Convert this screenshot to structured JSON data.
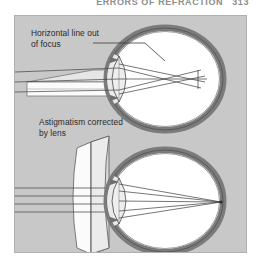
{
  "page": {
    "header_title": "ERRORS OF REFRACTION",
    "page_number": "313"
  },
  "figure": {
    "background_color": "#c8c8c8",
    "border_color": "#b0b0b0",
    "sclera_color": "#7b7b7b",
    "vitreous_color": "#ffffff",
    "ray_color": "#4a4a4a",
    "beam_fill": "#f2f2f2",
    "lens_fill": "#efefef",
    "panels": [
      {
        "id": "uncorrected",
        "label": "Horizontal line out\nof focus",
        "description": "Eye with astigmatism: horizontal rays focus in front of the retina, producing a blurred horizontal line."
      },
      {
        "id": "corrected",
        "label": "Astigmatism corrected\nby lens",
        "description": "Cylindrical spectacle lens placed before the eye brings the horizontal rays to a single point on the retina."
      }
    ]
  }
}
